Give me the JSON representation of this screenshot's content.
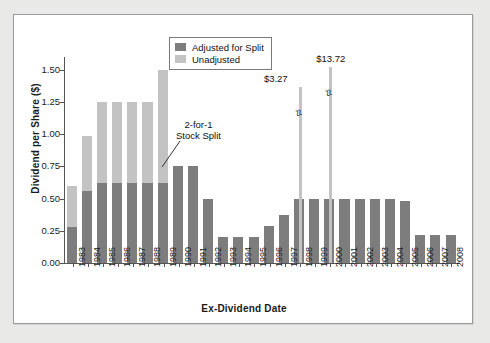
{
  "chart_data": {
    "type": "bar",
    "title": "",
    "xlabel": "Ex-Dividend Date",
    "ylabel": "Dividend per Share ($)",
    "ylim": [
      0.0,
      1.6
    ],
    "yticks": [
      "0.00",
      "0.25",
      "0.50",
      "0.75",
      "1.00",
      "1.25",
      "1.50"
    ],
    "ytick_values": [
      0.0,
      0.25,
      0.5,
      0.75,
      1.0,
      1.25,
      1.5
    ],
    "grid": false,
    "stacked": true,
    "legend_position": "top-center",
    "categories": [
      "1983",
      "1984",
      "1985",
      "1986",
      "1987",
      "1988",
      "1989",
      "1990",
      "1991",
      "1992",
      "1993",
      "1994",
      "1995",
      "1996",
      "1997",
      "1998",
      "1999",
      "2000",
      "2001",
      "2002",
      "2003",
      "2004",
      "2005",
      "2006",
      "2007",
      "2008"
    ],
    "series": [
      {
        "name": "Adjusted for Split",
        "color": "#7d7d7d",
        "values": [
          0.28,
          0.56,
          0.62,
          0.62,
          0.62,
          0.62,
          0.62,
          0.75,
          0.75,
          0.5,
          0.2,
          0.2,
          0.2,
          0.29,
          0.37,
          0.5,
          0.5,
          0.5,
          0.5,
          0.5,
          0.5,
          0.5,
          0.48,
          0.22,
          0.22,
          0.22
        ]
      },
      {
        "name": "Unadjusted",
        "color": "#c3c3c3",
        "values": [
          0.32,
          0.43,
          0.63,
          0.63,
          0.63,
          0.63,
          0.88,
          0.0,
          0.0,
          0.0,
          0.0,
          0.0,
          0.0,
          0.0,
          0.0,
          0.0,
          0.0,
          0.0,
          0.0,
          0.0,
          0.0,
          0.0,
          0.0,
          0.0,
          0.0,
          0.0
        ]
      }
    ],
    "special_bars": [
      {
        "category": "1998",
        "label": "$3.27",
        "value": 3.27,
        "broken_axis": true,
        "color": "#c3c3c3"
      },
      {
        "category": "2000",
        "label": "$13.72",
        "value": 13.72,
        "broken_axis": true,
        "color": "#c3c3c3"
      }
    ],
    "annotations": [
      {
        "text": "2-for-1\nStock Split",
        "line1": "2-for-1",
        "line2": "Stock Split",
        "points_to": "1990"
      }
    ]
  },
  "legend": {
    "items": [
      {
        "label": "Adjusted for Split",
        "color": "#7d7d7d"
      },
      {
        "label": "Unadjusted",
        "color": "#c3c3c3"
      }
    ]
  },
  "annotation": {
    "line1": "2-for-1",
    "line2": "Stock Split"
  },
  "spikes": [
    {
      "label": "$3.27"
    },
    {
      "label": "$13.72"
    }
  ],
  "axes": {
    "y_title": "Dividend per Share ($)",
    "x_title": "Ex-Dividend Date"
  }
}
